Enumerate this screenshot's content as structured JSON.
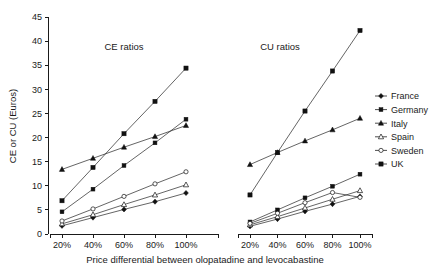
{
  "chart_data": {
    "type": "line",
    "title": "",
    "xlabel": "Price differential between olopatadine and levocabastine",
    "ylabel": "CE or CU (Euros)",
    "ylim": [
      0,
      45
    ],
    "ytick_step": 5,
    "yticks": [
      "0",
      "5",
      "10",
      "15",
      "20",
      "25",
      "30",
      "35",
      "40",
      "45"
    ],
    "grid": false,
    "legend_position": "right",
    "panels": [
      {
        "name": "ce",
        "title": "CE ratios",
        "categories": [
          "20%",
          "40%",
          "60%",
          "80%",
          "100%"
        ],
        "series": [
          {
            "name": "France",
            "marker": "diamond",
            "values": [
              1.7,
              3.4,
              5.1,
              6.7,
              8.5
            ]
          },
          {
            "name": "Germany",
            "marker": "square",
            "values": [
              4.6,
              9.3,
              14.2,
              18.9,
              23.8
            ]
          },
          {
            "name": "Italy",
            "marker": "triangle",
            "values": [
              13.4,
              15.7,
              18.0,
              20.2,
              22.5
            ]
          },
          {
            "name": "Spain",
            "marker": "open-triangle",
            "values": [
              2.1,
              4.0,
              6.1,
              8.1,
              10.2
            ]
          },
          {
            "name": "Sweden",
            "marker": "open-circle",
            "values": [
              2.7,
              5.2,
              7.8,
              10.4,
              12.9
            ]
          },
          {
            "name": "UK",
            "marker": "filled-square",
            "values": [
              6.9,
              13.8,
              20.8,
              27.5,
              34.4
            ]
          }
        ]
      },
      {
        "name": "cu",
        "title": "CU ratios",
        "categories": [
          "20%",
          "40%",
          "60%",
          "80%",
          "100%"
        ],
        "series": [
          {
            "name": "France",
            "marker": "diamond",
            "values": [
              1.6,
              3.1,
              4.7,
              6.2,
              7.8
            ]
          },
          {
            "name": "Germany",
            "marker": "square",
            "values": [
              2.5,
              5.0,
              7.5,
              9.9,
              12.4
            ]
          },
          {
            "name": "Italy",
            "marker": "triangle",
            "values": [
              14.4,
              16.9,
              19.3,
              21.6,
              24.0
            ]
          },
          {
            "name": "Spain",
            "marker": "open-triangle",
            "values": [
              1.9,
              3.6,
              5.4,
              7.2,
              9.0
            ]
          },
          {
            "name": "Sweden",
            "marker": "open-circle",
            "values": [
              2.2,
              4.3,
              6.5,
              8.6,
              7.6
            ]
          },
          {
            "name": "UK",
            "marker": "filled-square",
            "values": [
              8.1,
              16.9,
              25.5,
              33.8,
              42.2
            ]
          }
        ]
      }
    ],
    "legend": [
      {
        "label": "France",
        "marker": "diamond"
      },
      {
        "label": "Germany",
        "marker": "square"
      },
      {
        "label": "Italy",
        "marker": "triangle"
      },
      {
        "label": "Spain",
        "marker": "open-triangle"
      },
      {
        "label": "Sweden",
        "marker": "open-circle"
      },
      {
        "label": "UK",
        "marker": "filled-square"
      }
    ],
    "colors": {
      "line": "#222222",
      "marker": "#111111",
      "axis": "#1a1a1a",
      "background": "#ffffff"
    }
  }
}
